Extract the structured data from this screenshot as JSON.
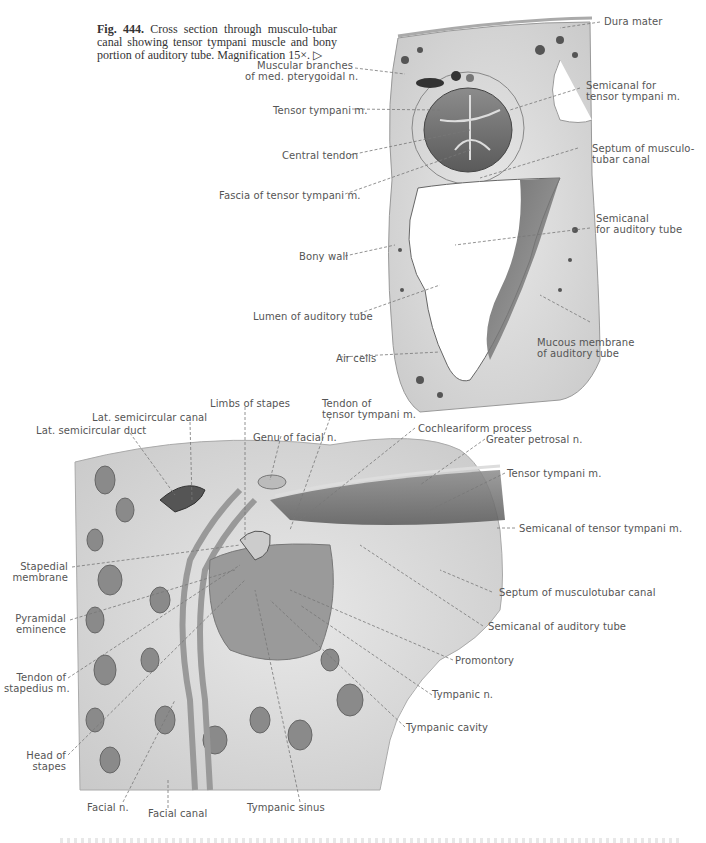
{
  "caption": {
    "fig_label": "Fig. 444.",
    "text": "Cross section through musculo-tubar canal showing tensor tympani muscle and bony portion of auditory tube. Magnification 15×.",
    "arrow": "▷"
  },
  "figure_top": {
    "labels": {
      "dura_mater": "Dura mater",
      "muscular_branches": "Muscular branches\nof med. pterygoidal n.",
      "semicanal_tensor": "Semicanal for\ntensor tympani m.",
      "tensor_tympani": "Tensor tympani m.",
      "central_tendon": "Central tendon",
      "septum": "Septum of musculo-\ntubar canal",
      "fascia": "Fascia of tensor tympani m.",
      "semicanal_auditory": "Semicanal\nfor auditory tube",
      "bony_wall": "Bony wall",
      "lumen": "Lumen of auditory tube",
      "mucous_membrane": "Mucous membrane\nof auditory tube",
      "air_cells": "Air cells"
    }
  },
  "figure_bottom": {
    "labels": {
      "limbs_stapes": "Limbs of stapes",
      "tendon_tensor": "Tendon of\ntensor tympani m.",
      "cochleariform": "Cochleariform process",
      "lat_canal": "Lat. semicircular canal",
      "lat_duct": "Lat. semicircular duct",
      "genu_facial": "Genu of facial n.",
      "greater_petrosal": "Greater petrosal n.",
      "tensor_tympani": "Tensor tympani m.",
      "semicanal_tensor": "Semicanal of tensor tympani m.",
      "stapedial_membrane": "Stapedial\nmembrane",
      "septum": "Septum of musculotubar canal",
      "pyramidal": "Pyramidal\neminence",
      "semicanal_auditory": "Semicanal of auditory tube",
      "promontory": "Promontory",
      "tendon_stapedius": "Tendon of\nstapedius m.",
      "tympanic_n": "Tympanic n.",
      "tympanic_cavity": "Tympanic cavity",
      "head_stapes": "Head of\nstapes",
      "facial_n": "Facial n.",
      "facial_canal": "Facial canal",
      "tympanic_sinus": "Tympanic sinus"
    }
  }
}
